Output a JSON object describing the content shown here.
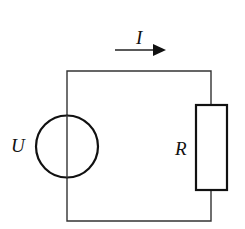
{
  "diagram": {
    "type": "circuit",
    "components": [
      {
        "id": "source",
        "kind": "voltage-source",
        "label": "U"
      },
      {
        "id": "resistor",
        "kind": "resistor",
        "label": "R"
      }
    ],
    "current": {
      "label": "I",
      "direction": "right"
    },
    "colors": {
      "stroke": "#1a1a1a",
      "background": "#ffffff"
    }
  }
}
